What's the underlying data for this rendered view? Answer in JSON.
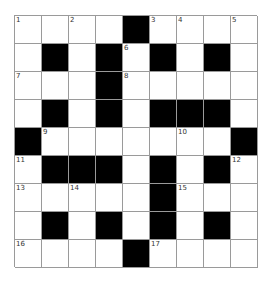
{
  "puzzle": {
    "rows": 9,
    "cols": 9,
    "colors": {
      "block": "#000000",
      "cell": "#ffffff",
      "line": "#9a9a9a"
    },
    "grid": [
      [
        "1",
        "",
        "2",
        "",
        "#",
        "3",
        "4",
        "",
        "5"
      ],
      [
        "",
        "#",
        "",
        "#",
        "6",
        "#",
        "",
        "#",
        ""
      ],
      [
        "7",
        "",
        "",
        "#",
        "8",
        "",
        "",
        "",
        ""
      ],
      [
        "",
        "#",
        "",
        "#",
        "",
        "#",
        "#",
        "#",
        ""
      ],
      [
        "#",
        "9",
        "",
        "",
        "",
        "",
        "10",
        "",
        "#"
      ],
      [
        "11",
        "#",
        "#",
        "#",
        "",
        "#",
        "",
        "#",
        "12"
      ],
      [
        "13",
        "",
        "14",
        "",
        "",
        "#",
        "15",
        "",
        ""
      ],
      [
        "",
        "#",
        "",
        "#",
        "",
        "#",
        "",
        "#",
        ""
      ],
      [
        "16",
        "",
        "",
        "",
        "#",
        "17",
        "",
        "",
        ""
      ]
    ]
  }
}
